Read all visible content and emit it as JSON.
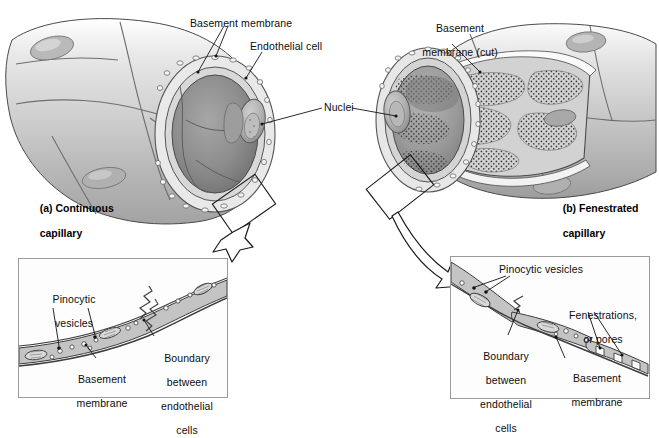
{
  "figure": {
    "background_color": "#ffffff",
    "line_color": "#1a1a1a",
    "tissue_fill": "#c9c9c9",
    "lumen_fill": "#8f8f8f"
  },
  "panels": {
    "a": {
      "caption_line1": "(a) Continuous",
      "caption_line2": "capillary"
    },
    "b": {
      "caption_line1": "(b) Fenestrated",
      "caption_line2": "capillary"
    }
  },
  "labels": {
    "basement_membrane": "Basement membrane",
    "endothelial_cell": "Endothelial cell",
    "nuclei": "Nuclei",
    "basement_membrane_cut_line1": "Basement",
    "basement_membrane_cut_line2": "membrane (cut)"
  },
  "inset_left": {
    "pinocytic_line1": "Pinocytic",
    "pinocytic_line2": "vesicles",
    "basement_line1": "Basement",
    "basement_line2": "membrane",
    "boundary_line1": "Boundary",
    "boundary_line2": "between",
    "boundary_line3": "endothelial",
    "boundary_line4": "cells"
  },
  "inset_right": {
    "pinocytic": "Pinocytic vesicles",
    "fenestrations_line1": "Fenestrations,",
    "fenestrations_line2": "or pores",
    "boundary_line1": "Boundary",
    "boundary_line2": "between",
    "boundary_line3": "endothelial",
    "boundary_line4": "cells",
    "basement_line1": "Basement",
    "basement_line2": "membrane"
  }
}
